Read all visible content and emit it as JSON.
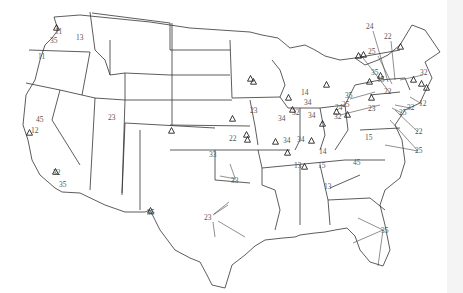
{
  "map": {
    "title": "",
    "type": "contiguous-us-site-map",
    "colors": {
      "background": "#ffffff",
      "borders": "#333333",
      "labels": "#555555"
    },
    "labels": [
      {
        "text": "11",
        "x": 60,
        "y": 32
      },
      {
        "text": "35",
        "x": 55,
        "y": 41
      },
      {
        "text": "13",
        "x": 81,
        "y": 38
      },
      {
        "text": "11",
        "x": 43,
        "y": 57
      },
      {
        "text": "45",
        "x": 41,
        "y": 120
      },
      {
        "text": "12",
        "x": 36,
        "y": 131
      },
      {
        "text": "23",
        "x": 113,
        "y": 118
      },
      {
        "text": "32",
        "x": 58,
        "y": 173
      },
      {
        "text": "35",
        "x": 64,
        "y": 185
      },
      {
        "text": "35",
        "x": 152,
        "y": 213
      },
      {
        "text": "33",
        "x": 214,
        "y": 155
      },
      {
        "text": "33",
        "x": 236,
        "y": 181
      },
      {
        "text": "23",
        "x": 209,
        "y": 218
      },
      {
        "text": "23",
        "x": 255,
        "y": 111
      },
      {
        "text": "22",
        "x": 234,
        "y": 139
      },
      {
        "text": "34",
        "x": 283,
        "y": 119
      },
      {
        "text": "14",
        "x": 306,
        "y": 93
      },
      {
        "text": "34",
        "x": 309,
        "y": 103
      },
      {
        "text": "32",
        "x": 297,
        "y": 113
      },
      {
        "text": "34",
        "x": 313,
        "y": 116
      },
      {
        "text": "14",
        "x": 324,
        "y": 152
      },
      {
        "text": "34",
        "x": 302,
        "y": 140
      },
      {
        "text": "34",
        "x": 288,
        "y": 141
      },
      {
        "text": "24",
        "x": 340,
        "y": 108
      },
      {
        "text": "25",
        "x": 347,
        "y": 105
      },
      {
        "text": "32",
        "x": 339,
        "y": 117
      },
      {
        "text": "35",
        "x": 350,
        "y": 96
      },
      {
        "text": "23",
        "x": 373,
        "y": 109
      },
      {
        "text": "15",
        "x": 370,
        "y": 138
      },
      {
        "text": "13",
        "x": 299,
        "y": 166
      },
      {
        "text": "15",
        "x": 323,
        "y": 166
      },
      {
        "text": "45",
        "x": 358,
        "y": 163
      },
      {
        "text": "13",
        "x": 329,
        "y": 187
      },
      {
        "text": "35",
        "x": 386,
        "y": 231
      },
      {
        "text": "24",
        "x": 371,
        "y": 27
      },
      {
        "text": "22",
        "x": 389,
        "y": 37
      },
      {
        "text": "25",
        "x": 373,
        "y": 52
      },
      {
        "text": "35",
        "x": 376,
        "y": 73
      },
      {
        "text": "15",
        "x": 382,
        "y": 80
      },
      {
        "text": "32",
        "x": 425,
        "y": 73
      },
      {
        "text": "22",
        "x": 389,
        "y": 92
      },
      {
        "text": "12",
        "x": 424,
        "y": 104
      },
      {
        "text": "32",
        "x": 412,
        "y": 108
      },
      {
        "text": "25",
        "x": 404,
        "y": 113
      },
      {
        "text": "22",
        "x": 420,
        "y": 132
      },
      {
        "text": "25",
        "x": 420,
        "y": 151
      }
    ],
    "triangles": [
      {
        "x": 56,
        "y": 27
      },
      {
        "x": 29,
        "y": 132
      },
      {
        "x": 55,
        "y": 171
      },
      {
        "x": 150,
        "y": 210
      },
      {
        "x": 171,
        "y": 130
      },
      {
        "x": 250,
        "y": 78
      },
      {
        "x": 253,
        "y": 81
      },
      {
        "x": 232,
        "y": 118
      },
      {
        "x": 246,
        "y": 134
      },
      {
        "x": 247,
        "y": 139
      },
      {
        "x": 275,
        "y": 141
      },
      {
        "x": 288,
        "y": 97
      },
      {
        "x": 292,
        "y": 109
      },
      {
        "x": 311,
        "y": 140
      },
      {
        "x": 304,
        "y": 166
      },
      {
        "x": 287,
        "y": 152
      },
      {
        "x": 322,
        "y": 123
      },
      {
        "x": 326,
        "y": 84
      },
      {
        "x": 336,
        "y": 111
      },
      {
        "x": 347,
        "y": 114
      },
      {
        "x": 369,
        "y": 81
      },
      {
        "x": 380,
        "y": 75
      },
      {
        "x": 358,
        "y": 55
      },
      {
        "x": 363,
        "y": 54
      },
      {
        "x": 400,
        "y": 46
      },
      {
        "x": 371,
        "y": 97
      },
      {
        "x": 426,
        "y": 87
      },
      {
        "x": 421,
        "y": 83
      },
      {
        "x": 413,
        "y": 79
      }
    ]
  }
}
